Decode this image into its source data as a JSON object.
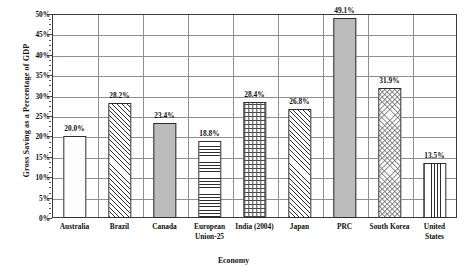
{
  "chart_data": {
    "type": "bar",
    "title": "",
    "xlabel": "Economy",
    "ylabel": "Gross Saving as a Percentage of GDP",
    "categories": [
      "Australia",
      "Brazil",
      "Canada",
      "European Union-25",
      "India (2004)",
      "Japan",
      "PRC",
      "South Korea",
      "United States"
    ],
    "values": [
      20.0,
      28.2,
      23.4,
      18.8,
      28.4,
      26.8,
      49.1,
      31.9,
      13.5
    ],
    "data_labels": [
      "20.0%",
      "28.2%",
      "23.4%",
      "18.8%",
      "28.4%",
      "26.8%",
      "49.1%",
      "31.9%",
      "13.5%"
    ],
    "ylim": [
      0,
      50
    ],
    "ytick_values": [
      0,
      5,
      10,
      15,
      20,
      25,
      30,
      35,
      40,
      45,
      50
    ],
    "ytick_labels": [
      "0%",
      "5%",
      "10%",
      "15%",
      "20%",
      "25%",
      "30%",
      "35%",
      "40%",
      "45%",
      "50%"
    ],
    "grid": "horizontal-and-category-vertical",
    "legend": "none",
    "bar_patterns": [
      "blank",
      "diagonal-hatch",
      "solid-gray",
      "horizontal-lines",
      "grid-checker",
      "diagonal-hatch",
      "solid-gray",
      "diamond-crosshatch",
      "vertical-lines"
    ],
    "colors": {
      "bar_outline": "#2d2d2d",
      "solid_fill": "#bcbcbc",
      "blank_fill": "#fdfdfd",
      "gridline": "#8f8f8f",
      "frame": "#3a3a3a",
      "text": "#111111",
      "background": "#ffffff"
    }
  },
  "x_label_lines": [
    [
      "Australia"
    ],
    [
      "Brazil"
    ],
    [
      "Canada"
    ],
    [
      "European",
      "Union-25"
    ],
    [
      "India (2004)"
    ],
    [
      "Japan"
    ],
    [
      "PRC"
    ],
    [
      "South Korea"
    ],
    [
      "United",
      "States"
    ]
  ]
}
